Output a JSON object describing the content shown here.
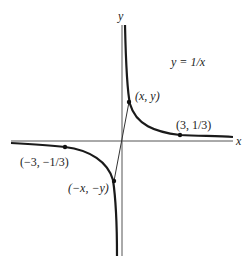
{
  "figure": {
    "equation_label": "y = 1/x",
    "axis_labels": {
      "x": "x",
      "y": "y"
    },
    "points": [
      {
        "label": "(x, y)",
        "px": 129,
        "py": 102
      },
      {
        "label": "(3, 1/3)",
        "px": 180,
        "py": 135
      },
      {
        "label": "(−3, −1/3)",
        "px": 65,
        "py": 147
      },
      {
        "label": "(−x, −y)",
        "px": 114,
        "py": 181
      }
    ],
    "colors": {
      "curve": "#1a1a1a",
      "axis": "#555555",
      "line": "#333333"
    }
  }
}
